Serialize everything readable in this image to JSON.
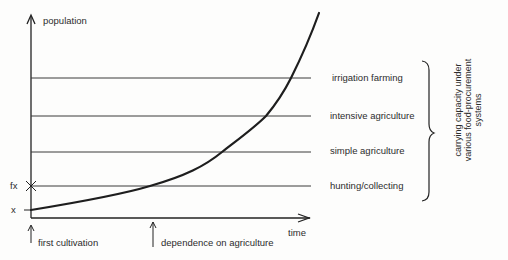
{
  "diagram": {
    "y_axis_label": "population",
    "x_axis_label": "time",
    "y_markers": {
      "fx": "fx",
      "x": "x"
    },
    "levels": [
      {
        "label": "irrigation farming",
        "y": 78
      },
      {
        "label": "intensive agriculture",
        "y": 116
      },
      {
        "label": "simple agriculture",
        "y": 152
      },
      {
        "label": "hunting/collecting",
        "y": 186
      }
    ],
    "brace_label_lines": [
      "carrying capacity under",
      "various food-procurement",
      "systems"
    ],
    "time_markers": [
      {
        "label": "first cultivation"
      },
      {
        "label": "dependence on agriculture"
      }
    ],
    "colors": {
      "ink": "#222222",
      "line": "#3a3a3a",
      "background": "#fdfdfc"
    }
  }
}
